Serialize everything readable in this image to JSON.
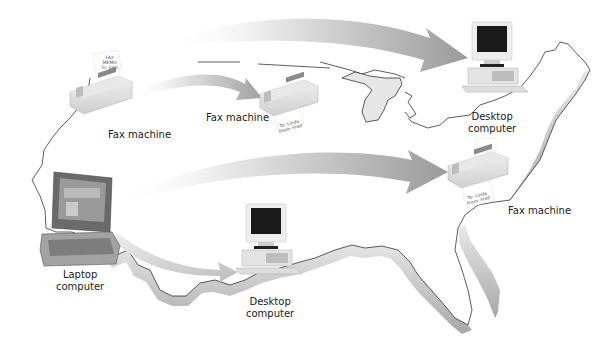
{
  "diagram": {
    "type": "network-map",
    "background": "#ffffff",
    "arrow_color": "#9a9a9a",
    "map_edge_color": "#bdbdbd",
    "devices": [
      {
        "id": "fax-west",
        "kind": "fax",
        "label": "Fax machine",
        "paper_text": [
          "FAX",
          "MEMO",
          "To: John"
        ]
      },
      {
        "id": "fax-midwest",
        "kind": "fax",
        "label": "Fax machine",
        "paper_text": [
          "To: Linda",
          "From: Fred"
        ]
      },
      {
        "id": "desktop-northeast",
        "kind": "desktop",
        "label_line1": "Desktop",
        "label_line2": "computer"
      },
      {
        "id": "fax-east",
        "kind": "fax",
        "label": "Fax machine",
        "paper_text": [
          "To: Linda",
          "From: Fred"
        ]
      },
      {
        "id": "laptop-west",
        "kind": "laptop",
        "label_line1": "Laptop",
        "label_line2": "computer"
      },
      {
        "id": "desktop-south",
        "kind": "desktop",
        "label_line1": "Desktop",
        "label_line2": "computer"
      }
    ],
    "connections": [
      {
        "from": "fax-west",
        "to": "fax-midwest"
      },
      {
        "from": "fax-west",
        "to": "desktop-northeast"
      },
      {
        "from": "laptop-west",
        "to": "fax-east"
      },
      {
        "from": "laptop-west",
        "to": "desktop-south"
      }
    ]
  }
}
